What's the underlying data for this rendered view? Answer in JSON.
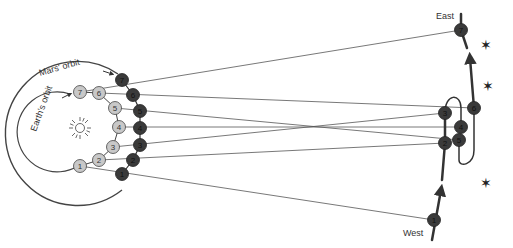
{
  "diagram": {
    "labels": {
      "mars_orbit": "Mars' orbit",
      "earth_orbit": "Earth's orbit",
      "east": "East",
      "west": "West"
    },
    "sun": {
      "x": 80,
      "y": 128,
      "icon": "sun-icon"
    },
    "earth_positions": [
      {
        "n": "1",
        "x": 80,
        "y": 166
      },
      {
        "n": "2",
        "x": 99,
        "y": 160
      },
      {
        "n": "3",
        "x": 113,
        "y": 147
      },
      {
        "n": "4",
        "x": 119,
        "y": 127
      },
      {
        "n": "5",
        "x": 115,
        "y": 108
      },
      {
        "n": "6",
        "x": 99,
        "y": 93
      },
      {
        "n": "7",
        "x": 80,
        "y": 92
      }
    ],
    "mars_positions": [
      {
        "n": "1",
        "x": 122,
        "y": 174
      },
      {
        "n": "2",
        "x": 133,
        "y": 160
      },
      {
        "n": "3",
        "x": 140,
        "y": 145
      },
      {
        "n": "4",
        "x": 140,
        "y": 128
      },
      {
        "n": "5",
        "x": 140,
        "y": 111
      },
      {
        "n": "6",
        "x": 133,
        "y": 95
      },
      {
        "n": "7",
        "x": 122,
        "y": 80
      }
    ],
    "sky_positions": [
      {
        "n": "1",
        "x": 434,
        "y": 220
      },
      {
        "n": "2",
        "x": 445,
        "y": 143
      },
      {
        "n": "3",
        "x": 445,
        "y": 113
      },
      {
        "n": "4",
        "x": 461,
        "y": 127
      },
      {
        "n": "5",
        "x": 459,
        "y": 140
      },
      {
        "n": "6",
        "x": 474,
        "y": 108
      },
      {
        "n": "7",
        "x": 461,
        "y": 30
      }
    ],
    "stars": [
      {
        "x": 486,
        "y": 45,
        "glyph": "✶"
      },
      {
        "x": 488,
        "y": 86,
        "glyph": "✶"
      },
      {
        "x": 486,
        "y": 183,
        "glyph": "✶"
      }
    ],
    "colors": {
      "earth_fill": "#c8c8c8",
      "mars_fill": "#3a3a3a",
      "orbit": "#444444",
      "sightline": "#555555",
      "path": "#333333"
    }
  }
}
